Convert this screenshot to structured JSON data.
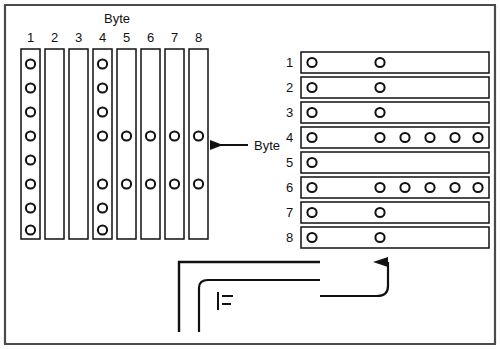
{
  "figure": {
    "title_top": "Byte",
    "title_middle": "Byte",
    "frame_color": "#3a3a3a",
    "ink_color": "#111111",
    "paper_color": "#ffffff"
  },
  "column_group": {
    "label": "Byte",
    "label_position": "top",
    "headers": [
      "1",
      "2",
      "3",
      "4",
      "5",
      "6",
      "7",
      "8"
    ],
    "row_count": 8,
    "columns": [
      {
        "name": "1",
        "holes": [
          1,
          2,
          3,
          4,
          5,
          6,
          7,
          8
        ]
      },
      {
        "name": "2",
        "holes": []
      },
      {
        "name": "3",
        "holes": []
      },
      {
        "name": "4",
        "holes": [
          1,
          2,
          3,
          4,
          6,
          7,
          8
        ]
      },
      {
        "name": "5",
        "holes": [
          4,
          6
        ]
      },
      {
        "name": "6",
        "holes": [
          4,
          6
        ]
      },
      {
        "name": "7",
        "holes": [
          4,
          6
        ]
      },
      {
        "name": "8",
        "holes": [
          4,
          6
        ]
      }
    ]
  },
  "row_group": {
    "label": "Byte",
    "label_position": "left",
    "headers": [
      "1",
      "2",
      "3",
      "4",
      "5",
      "6",
      "7",
      "8"
    ],
    "column_count": 6,
    "rows": [
      {
        "name": "1",
        "holes": [
          1,
          2
        ]
      },
      {
        "name": "2",
        "holes": [
          1,
          2
        ]
      },
      {
        "name": "3",
        "holes": [
          1,
          2
        ]
      },
      {
        "name": "4",
        "holes": [
          1,
          2,
          3,
          4,
          5,
          6
        ]
      },
      {
        "name": "5",
        "holes": [
          1
        ]
      },
      {
        "name": "6",
        "holes": [
          1,
          2,
          3,
          4,
          5,
          6
        ]
      },
      {
        "name": "7",
        "holes": [
          1,
          2
        ]
      },
      {
        "name": "8",
        "holes": [
          1,
          2
        ]
      }
    ]
  },
  "annotations": {
    "left_arrow_label": "Byte",
    "left_arrow_direction": "left",
    "up_arrow_direction": "up",
    "connector_glyph": "tick-mark"
  }
}
